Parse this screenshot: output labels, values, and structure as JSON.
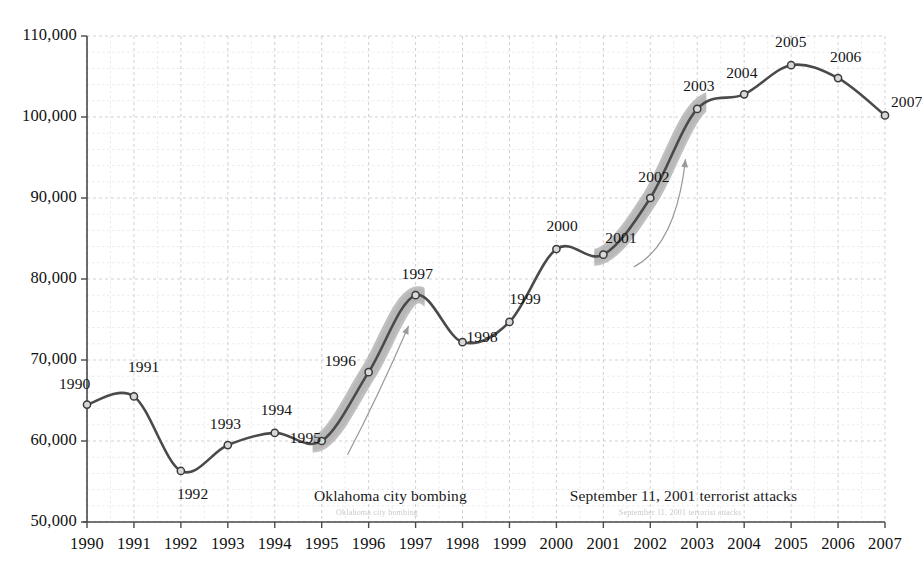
{
  "chart_data": {
    "type": "line",
    "title": "",
    "xlabel": "",
    "ylabel": "",
    "grid": true,
    "legend": "none",
    "xlim": [
      1990,
      2007
    ],
    "ylim": [
      50000,
      110000
    ],
    "y_ticks": [
      "50,000",
      "60,000",
      "70,000",
      "80,000",
      "90,000",
      "100,000",
      "110,000"
    ],
    "y_tick_values": [
      50000,
      60000,
      70000,
      80000,
      90000,
      100000,
      110000
    ],
    "categories": [
      "1990",
      "1991",
      "1992",
      "1993",
      "1994",
      "1995",
      "1996",
      "1997",
      "1998",
      "1999",
      "2000",
      "2001",
      "2002",
      "2003",
      "2004",
      "2005",
      "2006",
      "2007"
    ],
    "x": [
      1990,
      1991,
      1992,
      1993,
      1994,
      1995,
      1996,
      1997,
      1998,
      1999,
      2000,
      2001,
      2002,
      2003,
      2004,
      2005,
      2006,
      2007
    ],
    "values": [
      64500,
      65500,
      56300,
      59500,
      61000,
      60000,
      68500,
      78000,
      72200,
      74700,
      83700,
      83000,
      90000,
      101000,
      102800,
      106400,
      104800,
      100200
    ],
    "point_labels": [
      "1990",
      "1991",
      "1992",
      "1993",
      "1994",
      "1995",
      "1996",
      "1997",
      "1998",
      "1999",
      "2000",
      "2001",
      "2002",
      "2003",
      "2004",
      "2005",
      "2006",
      "2007"
    ],
    "series": [
      {
        "name": "series-1",
        "values": [
          64500,
          65500,
          56300,
          59500,
          61000,
          60000,
          68500,
          78000,
          72200,
          74700,
          83700,
          83000,
          90000,
          101000,
          102800,
          106400,
          104800,
          100200
        ]
      }
    ],
    "highlight_bands": [
      {
        "name": "oklahoma-band",
        "from_year": 1995,
        "to_year": 1997
      },
      {
        "name": "sept11-band",
        "from_year": 2001,
        "to_year": 2003
      }
    ],
    "annotations": [
      {
        "name": "oklahoma-city-bombing",
        "text": "Oklahoma city bombing"
      },
      {
        "name": "september-11-attacks",
        "text": "September 11, 2001 terrorist attacks"
      }
    ],
    "colors": {
      "line": "#4a4a4a",
      "marker_fill": "#d8d8d8",
      "marker_stroke": "#3a3a3a",
      "highlight_band": "#b0b0b0",
      "grid_major": "#c8c8d4",
      "grid_minor": "#e2e2ea",
      "axis": "#4a4a4a",
      "text": "#141414",
      "arrow": "#9a9a9a",
      "ghost_text": "#c9c9c9"
    }
  },
  "y_axis": {
    "ticks": [
      {
        "label": "110,000"
      },
      {
        "label": "100,000"
      },
      {
        "label": "90,000"
      },
      {
        "label": "80,000"
      },
      {
        "label": "70,000"
      },
      {
        "label": "60,000"
      },
      {
        "label": "50,000"
      }
    ]
  },
  "x_axis": {
    "ticks": [
      {
        "label": "1990"
      },
      {
        "label": "1991"
      },
      {
        "label": "1992"
      },
      {
        "label": "1993"
      },
      {
        "label": "1994"
      },
      {
        "label": "1995"
      },
      {
        "label": "1996"
      },
      {
        "label": "1997"
      },
      {
        "label": "1998"
      },
      {
        "label": "1999"
      },
      {
        "label": "2000"
      },
      {
        "label": "2001"
      },
      {
        "label": "2002"
      },
      {
        "label": "2003"
      },
      {
        "label": "2004"
      },
      {
        "label": "2005"
      },
      {
        "label": "2006"
      },
      {
        "label": "2007"
      }
    ]
  },
  "annotations": {
    "oklahoma": {
      "text": "Oklahoma city bombing",
      "ghost": "Oklahoma city bombing"
    },
    "sept11": {
      "text": "September 11, 2001 terrorist attacks",
      "ghost": "September 11, 2001 terrorist attacks"
    }
  }
}
